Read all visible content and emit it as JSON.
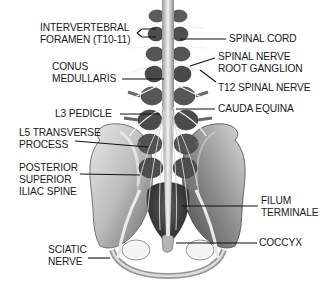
{
  "diagram": {
    "labels": [
      {
        "id": "intervertebral-foramen",
        "lines": [
          "INTERVERTEBRAL",
          "FORAMEN (T10-11)"
        ],
        "side": "left"
      },
      {
        "id": "conus-medullaris",
        "lines": [
          "CONUS",
          "MEDULLARIS"
        ],
        "side": "left"
      },
      {
        "id": "l3-pedicle",
        "lines": [
          "L3 PEDICLE"
        ],
        "side": "left"
      },
      {
        "id": "l5-transverse-process",
        "lines": [
          "L5 TRANSVERSE",
          "PROCESS"
        ],
        "side": "left"
      },
      {
        "id": "posterior-superior-iliac-spine",
        "lines": [
          "POSTERIOR",
          "SUPERIOR",
          "ILIAC SPINE"
        ],
        "side": "left"
      },
      {
        "id": "sciatic-nerve",
        "lines": [
          "SCIATIC",
          "NERVE"
        ],
        "side": "left"
      },
      {
        "id": "spinal-cord",
        "lines": [
          "SPINAL CORD"
        ],
        "side": "right"
      },
      {
        "id": "spinal-nerve-root-ganglion",
        "lines": [
          "SPINAL NERVE",
          "ROOT GANGLION"
        ],
        "side": "right"
      },
      {
        "id": "t12-spinal-nerve",
        "lines": [
          "T12 SPINAL NERVE"
        ],
        "side": "right"
      },
      {
        "id": "cauda-equina",
        "lines": [
          "CAUDA EQUINA"
        ],
        "side": "right"
      },
      {
        "id": "filum-terminale",
        "lines": [
          "FILUM",
          "TERMINALE"
        ],
        "side": "right"
      },
      {
        "id": "coccyx",
        "lines": [
          "COCCYX"
        ],
        "side": "right"
      }
    ]
  }
}
